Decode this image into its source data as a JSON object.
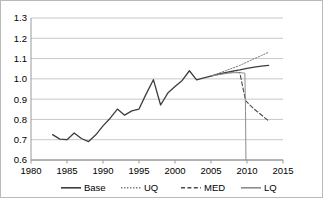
{
  "chart_data": {
    "type": "line",
    "title": "",
    "subtitle": "",
    "xlabel": "",
    "ylabel": "",
    "xlim": [
      1980,
      2015
    ],
    "ylim": [
      0.6,
      1.3
    ],
    "xticks": [
      1980,
      1985,
      1990,
      1995,
      2000,
      2005,
      2010,
      2015
    ],
    "xtick_labels": [
      "1980",
      "1985",
      "1990",
      "1995",
      "2000",
      "2005",
      "2010",
      "2015"
    ],
    "yticks": [
      0.6,
      0.7,
      0.8,
      0.9,
      1.0,
      1.1,
      1.2,
      1.3
    ],
    "ytick_labels": [
      "0.6",
      "0.7",
      "0.8",
      "0.9",
      "1.0",
      "1.1",
      "1.2",
      "1.3"
    ],
    "grid": "horizontal",
    "legend_position": "bottom",
    "plot_bg": "#ffffff",
    "grid_color": "#c8c8c8",
    "axis_color": "#9a9a9a",
    "series": [
      {
        "name": "Base",
        "style": "solid",
        "color": "#3d3d3d",
        "width": 1.3,
        "x": [
          1983,
          1984,
          1985,
          1986,
          1987,
          1988,
          1989,
          1990,
          1991,
          1992,
          1993,
          1994,
          1995,
          1996,
          1997,
          1998,
          1999,
          2000,
          2001,
          2002,
          2003,
          2004,
          2005,
          2006,
          2007,
          2008,
          2009,
          2010,
          2011,
          2012,
          2013
        ],
        "y": [
          0.725,
          0.703,
          0.7,
          0.733,
          0.706,
          0.691,
          0.724,
          0.768,
          0.806,
          0.851,
          0.821,
          0.842,
          0.851,
          0.926,
          0.996,
          0.871,
          0.93,
          0.962,
          0.992,
          1.04,
          0.995,
          1.005,
          1.014,
          1.023,
          1.031,
          1.038,
          1.044,
          1.052,
          1.058,
          1.063,
          1.066
        ]
      },
      {
        "name": "UQ",
        "style": "dotted",
        "color": "#7a7a7a",
        "width": 1.0,
        "x": [
          2005,
          2006,
          2007,
          2008,
          2009,
          2010,
          2011,
          2012,
          2013
        ],
        "y": [
          1.014,
          1.026,
          1.04,
          1.053,
          1.066,
          1.083,
          1.099,
          1.115,
          1.131
        ]
      },
      {
        "name": "MED",
        "style": "dashed",
        "color": "#4a4a4a",
        "width": 1.1,
        "x": [
          2005,
          2006,
          2007,
          2008,
          2009,
          2009.8,
          2010.2,
          2011,
          2012,
          2013
        ],
        "y": [
          1.014,
          1.022,
          1.029,
          1.035,
          1.03,
          0.893,
          0.878,
          0.851,
          0.822,
          0.793
        ]
      },
      {
        "name": "LQ",
        "style": "solid",
        "color": "#8d8d8d",
        "width": 1.0,
        "x": [
          2005,
          2006,
          2007,
          2008,
          2009,
          2009.7,
          2009.8,
          2009.85
        ],
        "y": [
          1.014,
          1.02,
          1.026,
          1.03,
          1.031,
          1.028,
          0.84,
          0.6
        ]
      }
    ],
    "legend": [
      {
        "label": "Base",
        "style": "solid",
        "color": "#3d3d3d"
      },
      {
        "label": "UQ",
        "style": "dotted",
        "color": "#7a7a7a"
      },
      {
        "label": "MED",
        "style": "dashed",
        "color": "#4a4a4a"
      },
      {
        "label": "LQ",
        "style": "solid",
        "color": "#8d8d8d"
      }
    ]
  }
}
